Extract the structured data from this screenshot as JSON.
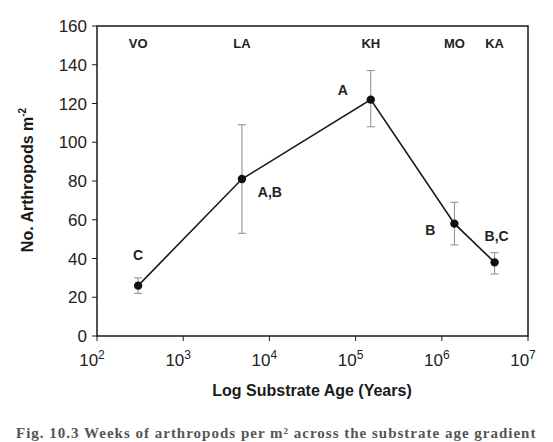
{
  "chart_data": {
    "type": "line",
    "title": "",
    "xlabel": "Log Substrate Age (Years)",
    "ylabel": "No. Arthropods m",
    "ylabel_superscript": "-2",
    "xscale": "log",
    "xlim": [
      100,
      10000000
    ],
    "ylim": [
      0,
      160
    ],
    "x_ticks": [
      {
        "base": "10",
        "exp": "2",
        "value": 100
      },
      {
        "base": "10",
        "exp": "3",
        "value": 1000
      },
      {
        "base": "10",
        "exp": "4",
        "value": 10000
      },
      {
        "base": "10",
        "exp": "5",
        "value": 100000
      },
      {
        "base": "10",
        "exp": "6",
        "value": 1000000
      },
      {
        "base": "10",
        "exp": "7",
        "value": 10000000
      }
    ],
    "y_ticks": [
      0,
      20,
      40,
      60,
      80,
      100,
      120,
      140,
      160
    ],
    "grid": false,
    "legend": null,
    "site_labels": [
      {
        "label": "VO",
        "x": 300
      },
      {
        "label": "LA",
        "x": 4800
      },
      {
        "label": "KH",
        "x": 150000
      },
      {
        "label": "MO",
        "x": 1400000
      },
      {
        "label": "KA",
        "x": 4100000
      }
    ],
    "series": [
      {
        "name": "Arthropod density",
        "points": [
          {
            "site": "VO",
            "x": 300,
            "y": 26,
            "err_low": 22,
            "err_high": 30,
            "group": "C"
          },
          {
            "site": "LA",
            "x": 4800,
            "y": 81,
            "err_low": 53,
            "err_high": 109,
            "group": "A,B"
          },
          {
            "site": "KH",
            "x": 150000,
            "y": 122,
            "err_low": 108,
            "err_high": 137,
            "group": "A"
          },
          {
            "site": "MO",
            "x": 1400000,
            "y": 58,
            "err_low": 47,
            "err_high": 69,
            "group": "B"
          },
          {
            "site": "KA",
            "x": 4100000,
            "y": 38,
            "err_low": 32,
            "err_high": 43,
            "group": "B,C"
          }
        ]
      }
    ]
  },
  "caption": "Fig. 10.3  Weeks of arthropods per m² across the substrate age gradient",
  "colors": {
    "line": "#1a1a1a",
    "marker": "#111111",
    "error_bar": "#8a8a8a",
    "axis": "#1a1a1a"
  }
}
